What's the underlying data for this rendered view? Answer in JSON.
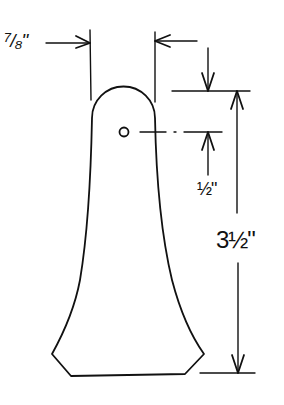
{
  "diagram": {
    "dimensions": {
      "width_top": {
        "label": "7/8\"",
        "value_in": 0.875
      },
      "hole_offset_from_top": {
        "label": "1/2\"",
        "value_in": 0.5
      },
      "overall_height": {
        "label": "3 1/2\"",
        "value_in": 3.5
      }
    },
    "labels": {
      "width_top": "⁷/₈\"",
      "hole_offset": "½\"",
      "overall_height": "3½\""
    },
    "colors": {
      "line": "#111111",
      "background": "#ffffff"
    }
  }
}
